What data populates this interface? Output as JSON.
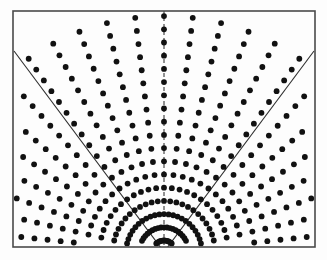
{
  "figure": {
    "kind": "radial-dot-lattice",
    "canvas": {
      "width": 327,
      "height": 260
    },
    "background_color": "#fdfdfd"
  },
  "frame": {
    "name": "plot-frame",
    "x": 13,
    "y": 11,
    "width": 302,
    "height": 236,
    "stroke_color": "#4a4a4a",
    "stroke_width": 1.6,
    "fill_color": "#fdfdfd"
  },
  "focus": {
    "label": "focal-point",
    "x": 164,
    "y": 252,
    "visible": false
  },
  "dots": {
    "color": "#111111",
    "radius": 2.9,
    "count_estimate": 286,
    "arrangement": "polar lattice: uniform radial steps on rays of uniform angular steps about the focal point",
    "radial_step": 13.2,
    "radial_start": 11.5,
    "radial_count": 18,
    "angular_step_deg": 7.0,
    "angular_half_span_deg": 91,
    "clip_to_frame": true
  },
  "center_line": {
    "name": "center-axis",
    "style": "dashed",
    "dash_pattern": "4,3",
    "stroke_color": "#3a3a3a",
    "stroke_width": 1.1,
    "angle_deg": 0,
    "from": {
      "x": 164,
      "y": 252
    },
    "to": {
      "x": 164,
      "y": 11
    }
  },
  "rays": [
    {
      "name": "left-boundary-ray",
      "style": "solid",
      "stroke_color": "#2e2e2e",
      "stroke_width": 1.1,
      "angle_deg": -43,
      "from": {
        "x": 164,
        "y": 252
      },
      "to": {
        "x": 14,
        "y": 51
      }
    },
    {
      "name": "right-boundary-ray",
      "style": "solid",
      "stroke_color": "#2e2e2e",
      "stroke_width": 1.1,
      "angle_deg": 43,
      "from": {
        "x": 164,
        "y": 252
      },
      "to": {
        "x": 314,
        "y": 51
      }
    }
  ],
  "chart_data": {
    "type": "scatter",
    "xlabel": "",
    "ylabel": "",
    "xlim": [
      13,
      315
    ],
    "ylim": [
      11,
      247
    ],
    "grid": false,
    "legend": null,
    "annotations": [
      "dashed vertical center axis through the focus",
      "solid left boundary ray at -43 degrees",
      "solid right boundary ray at +43 degrees"
    ],
    "generator": {
      "focus_x": 164,
      "focus_y": 252,
      "radii": [
        11.5,
        24.7,
        37.9,
        51.1,
        64.3,
        77.5,
        90.7,
        103.9,
        117.1,
        130.3,
        143.5,
        156.7,
        169.9,
        183.1,
        196.3,
        209.5,
        222.7,
        235.9
      ],
      "angles_deg": [
        -91,
        -84,
        -77,
        -70,
        -63,
        -56,
        -49,
        -42,
        -35,
        -28,
        -21,
        -14,
        -7,
        0,
        7,
        14,
        21,
        28,
        35,
        42,
        49,
        56,
        63,
        70,
        77,
        84,
        91
      ]
    }
  }
}
